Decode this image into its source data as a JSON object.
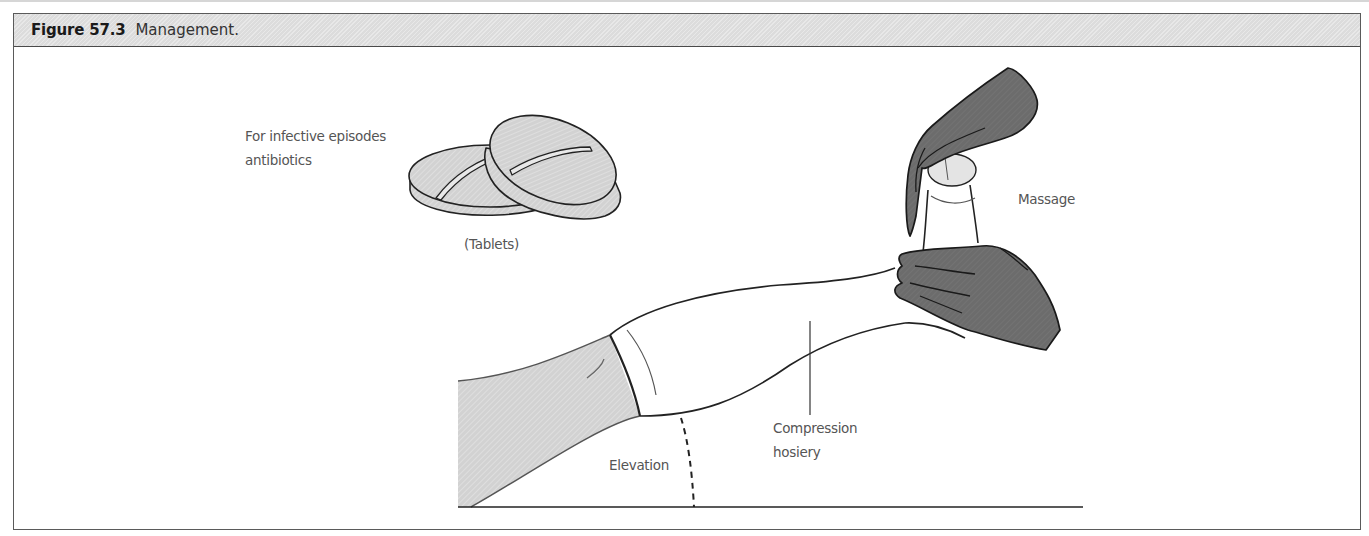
{
  "figure": {
    "number": "Figure 57.3",
    "caption": "Management."
  },
  "labels": {
    "antibiotics_line1": "For infective episodes",
    "antibiotics_line2": "antibiotics",
    "tablets": "(Tablets)",
    "massage": "Massage",
    "compression_line1": "Compression",
    "compression_line2": "hosiery",
    "elevation": "Elevation"
  },
  "colors": {
    "hatch_fill": "#d4d4d4",
    "glove_fill": "#6e6e6e",
    "outline": "#222222",
    "label_text": "#555555"
  }
}
